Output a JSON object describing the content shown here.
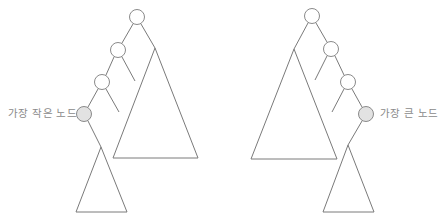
{
  "diagram": {
    "type": "binary-search-tree-illustration",
    "left_tree": {
      "label": "가장 작은 노드",
      "description": "Smallest node found by following left children from root",
      "nodes": [
        {
          "id": "L-root",
          "cx": 137,
          "cy": 17,
          "highlighted": false
        },
        {
          "id": "L-n1",
          "cx": 118,
          "cy": 50,
          "highlighted": false
        },
        {
          "id": "L-n2",
          "cx": 102,
          "cy": 82,
          "highlighted": false
        },
        {
          "id": "L-min",
          "cx": 84,
          "cy": 114,
          "highlighted": true
        }
      ]
    },
    "right_tree": {
      "label": "가장 큰 노드",
      "description": "Largest node found by following right children from root",
      "nodes": [
        {
          "id": "R-root",
          "cx": 312,
          "cy": 16,
          "highlighted": false
        },
        {
          "id": "R-n1",
          "cx": 331,
          "cy": 49,
          "highlighted": false
        },
        {
          "id": "R-n2",
          "cx": 348,
          "cy": 82,
          "highlighted": false
        },
        {
          "id": "R-max",
          "cx": 366,
          "cy": 114,
          "highlighted": true
        }
      ]
    },
    "colors": {
      "line": "#7a7a7a",
      "node_stroke": "#8a8a8a",
      "highlight_fill": "#e2e2e2",
      "label": "#8a8a8a"
    }
  }
}
